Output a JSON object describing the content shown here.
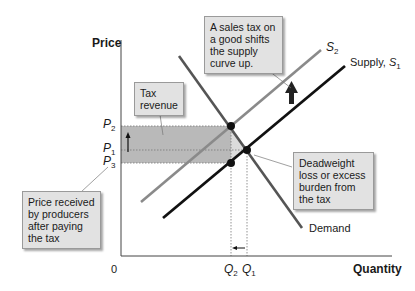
{
  "axes": {
    "y_label": "Price",
    "x_label": "Quantity",
    "origin": "0"
  },
  "price_labels": {
    "p2": {
      "letter": "P",
      "sub": "2"
    },
    "p1": {
      "letter": "P",
      "sub": "1"
    },
    "p3": {
      "letter": "P",
      "sub": "3"
    }
  },
  "quantity_labels": {
    "q2": {
      "letter": "Q",
      "sub": "2"
    },
    "q1": {
      "letter": "Q",
      "sub": "1"
    }
  },
  "curves": {
    "s2": {
      "letter": "S",
      "sub": "2"
    },
    "s1": {
      "prefix": "Supply, ",
      "letter": "S",
      "sub": "1"
    },
    "demand": "Demand"
  },
  "callouts": {
    "sales_tax": "A sales tax on a good shifts the supply curve up.",
    "tax_revenue": "Tax revenue",
    "producer_price": "Price received by producers after paying the tax",
    "deadweight": "Deadweight loss or excess burden from the tax"
  },
  "colors": {
    "supply_s1": "#111111",
    "supply_s2": "#8a8a8a",
    "demand": "#555555",
    "tax_revenue_fill": "#b8b8b8",
    "deadweight_fill": "#d9d9d9",
    "callout_bg": "#e2e2e2"
  }
}
